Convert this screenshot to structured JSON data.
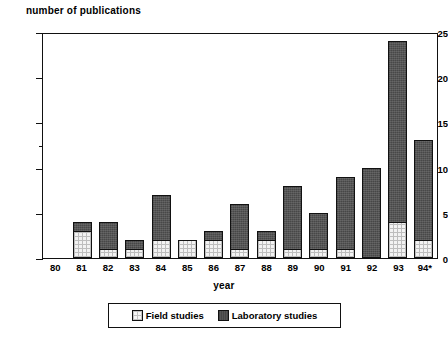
{
  "chart_data": {
    "type": "bar",
    "subtype": "stacked-bar",
    "title": "",
    "ylabel": "number of publications",
    "xlabel": "year",
    "ylim": [
      0,
      25
    ],
    "yticks": [
      0,
      5,
      10,
      15,
      20,
      25
    ],
    "ytick_labels": [
      "0",
      "5",
      "10",
      "15",
      "20",
      "25"
    ],
    "minor_yticks": [
      12.5
    ],
    "grid": false,
    "legend_position": "bottom",
    "categories": [
      "80",
      "81",
      "82",
      "83",
      "84",
      "85",
      "86",
      "87",
      "88",
      "89",
      "90",
      "91",
      "92",
      "93",
      "94*"
    ],
    "series": [
      {
        "name": "Field studies",
        "color": "#f2f2f2",
        "values": [
          0,
          3,
          1,
          1,
          2,
          2,
          2,
          1,
          2,
          1,
          1,
          1,
          0,
          4,
          2
        ]
      },
      {
        "name": "Laboratory studies",
        "color": "#555555",
        "values": [
          0,
          1,
          3,
          1,
          5,
          0,
          1,
          5,
          1,
          7,
          4,
          8,
          10,
          20,
          11
        ]
      }
    ],
    "totals": [
      0,
      4,
      4,
      2,
      7,
      2,
      3,
      6,
      3,
      8,
      5,
      9,
      10,
      24,
      13
    ]
  },
  "legend": {
    "entries": [
      {
        "label": "Field studies",
        "swatch": "field-swatch"
      },
      {
        "label": "Laboratory studies",
        "swatch": "laboratory-swatch"
      }
    ]
  }
}
